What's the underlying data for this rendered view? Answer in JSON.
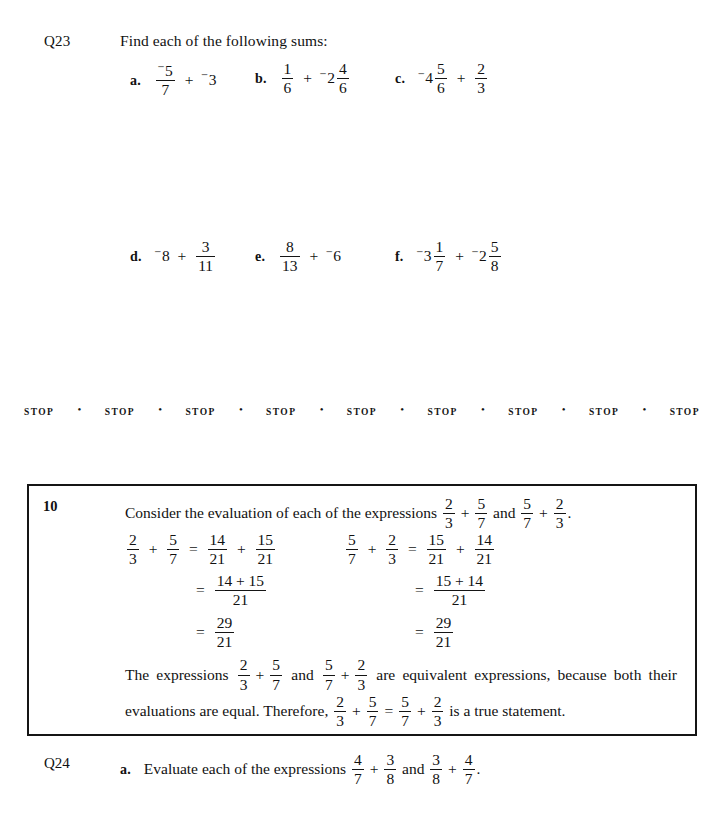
{
  "page": {
    "background": "#ffffff",
    "ink": "#111111"
  },
  "q23": {
    "label": "Q23",
    "prompt": "Find each of the following sums:",
    "row1": [
      {
        "letter": "a.",
        "terms": [
          {
            "type": "fraction",
            "negative": true,
            "numerator": "5",
            "denominator": "7"
          },
          {
            "type": "operator",
            "symbol": "+"
          },
          {
            "type": "integer",
            "negative": true,
            "value": "3"
          }
        ]
      },
      {
        "letter": "b.",
        "terms": [
          {
            "type": "fraction",
            "negative": false,
            "numerator": "1",
            "denominator": "6"
          },
          {
            "type": "operator",
            "symbol": "+"
          },
          {
            "type": "mixed",
            "negative": true,
            "whole": "2",
            "numerator": "4",
            "denominator": "6"
          }
        ]
      },
      {
        "letter": "c.",
        "terms": [
          {
            "type": "mixed",
            "negative": true,
            "whole": "4",
            "numerator": "5",
            "denominator": "6"
          },
          {
            "type": "operator",
            "symbol": "+"
          },
          {
            "type": "fraction",
            "negative": false,
            "numerator": "2",
            "denominator": "3"
          }
        ]
      }
    ],
    "row2": [
      {
        "letter": "d.",
        "terms": [
          {
            "type": "integer",
            "negative": true,
            "value": "8"
          },
          {
            "type": "operator",
            "symbol": "+"
          },
          {
            "type": "fraction",
            "negative": false,
            "numerator": "3",
            "denominator": "11"
          }
        ]
      },
      {
        "letter": "e.",
        "terms": [
          {
            "type": "fraction",
            "negative": false,
            "numerator": "8",
            "denominator": "13"
          },
          {
            "type": "operator",
            "symbol": "+"
          },
          {
            "type": "integer",
            "negative": true,
            "value": "6"
          }
        ]
      },
      {
        "letter": "f.",
        "terms": [
          {
            "type": "mixed",
            "negative": true,
            "whole": "3",
            "numerator": "1",
            "denominator": "7"
          },
          {
            "type": "operator",
            "symbol": "+"
          },
          {
            "type": "mixed",
            "negative": true,
            "whole": "2",
            "numerator": "5",
            "denominator": "8"
          }
        ]
      }
    ]
  },
  "stop_rule": {
    "word": "STOP",
    "dot": "•",
    "repeats": 9
  },
  "a23": {
    "label": "A23",
    "answers": [
      {
        "letter": "a.",
        "negative": true,
        "numerator": "26",
        "denominator": "7"
      },
      {
        "letter": "b.",
        "negative": true,
        "numerator": "5",
        "denominator": "2"
      },
      {
        "letter": "c.",
        "negative": true,
        "numerator": "25",
        "denominator": "6"
      },
      {
        "letter": "d.",
        "negative": true,
        "numerator": "85",
        "denominator": "11"
      },
      {
        "letter": "e.",
        "negative": true,
        "numerator": "70",
        "denominator": "13"
      },
      {
        "letter": "f.",
        "negative": true,
        "numerator": "323",
        "denominator": "56"
      }
    ]
  },
  "example_box": {
    "number": "10",
    "heading_before": "Consider the evaluation of each of the expressions",
    "heading_expr1": {
      "a_num": "2",
      "a_den": "3",
      "b_num": "5",
      "b_den": "7"
    },
    "heading_and": "and",
    "heading_expr2": {
      "a_num": "5",
      "a_den": "7",
      "b_num": "2",
      "b_den": "3"
    },
    "heading_period": ".",
    "left_work": {
      "line1": {
        "a_num": "2",
        "a_den": "3",
        "plus": "+",
        "b_num": "5",
        "b_den": "7",
        "eq": "=",
        "c_num": "14",
        "c_den": "21",
        "plus2": "+",
        "d_num": "15",
        "d_den": "21"
      },
      "line2": {
        "eq": "=",
        "num": "14 + 15",
        "den": "21"
      },
      "line3": {
        "eq": "=",
        "num": "29",
        "den": "21"
      }
    },
    "right_work": {
      "line1": {
        "a_num": "5",
        "a_den": "7",
        "plus": "+",
        "b_num": "2",
        "b_den": "3",
        "eq": "=",
        "c_num": "15",
        "c_den": "21",
        "plus2": "+",
        "d_num": "14",
        "d_den": "21"
      },
      "line2": {
        "eq": "=",
        "num": "15 + 14",
        "den": "21"
      },
      "line3": {
        "eq": "=",
        "num": "29",
        "den": "21"
      }
    },
    "paragraph": {
      "seg1": "The expressions",
      "expr1": {
        "a_num": "2",
        "a_den": "3",
        "b_num": "5",
        "b_den": "7"
      },
      "seg2": "and",
      "expr2": {
        "a_num": "5",
        "a_den": "7",
        "b_num": "2",
        "b_den": "3"
      },
      "seg3": "are equivalent expressions, because both their evaluations are equal. Therefore,",
      "expr3": {
        "a_num": "2",
        "a_den": "3",
        "b_num": "5",
        "b_den": "7",
        "eq": "=",
        "c_num": "5",
        "c_den": "7",
        "d_num": "2",
        "d_den": "3"
      },
      "seg4": "is a true statement."
    }
  },
  "q24": {
    "label": "Q24",
    "letter": "a.",
    "text_before": "Evaluate each of the expressions",
    "expr1": {
      "a_num": "4",
      "a_den": "7",
      "b_num": "3",
      "b_den": "8"
    },
    "and": "and",
    "expr2": {
      "a_num": "3",
      "a_den": "8",
      "b_num": "4",
      "b_den": "7"
    },
    "period": "."
  }
}
